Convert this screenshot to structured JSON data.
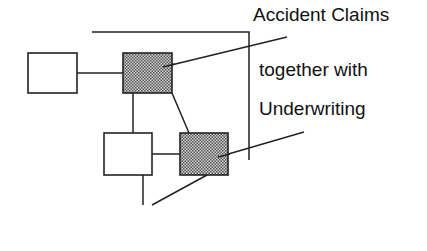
{
  "diagram": {
    "labels": {
      "line1": "Accident Claims",
      "line2": "together with",
      "line3": "Underwriting"
    },
    "nodes": [
      {
        "id": "A",
        "shaded": false
      },
      {
        "id": "B",
        "shaded": true
      },
      {
        "id": "C",
        "shaded": false
      },
      {
        "id": "D",
        "shaded": true
      }
    ],
    "colors": {
      "stroke": "#222222",
      "shade": "#a8a8a8",
      "background": "#ffffff"
    }
  }
}
